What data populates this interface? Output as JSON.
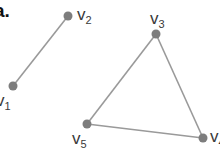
{
  "part_label": "a.",
  "colors": {
    "edge": "#9a9a9a",
    "vertex": "#7d7d7d",
    "text": "#3a3a3a"
  },
  "vertices": [
    {
      "id": "v1",
      "name": "v",
      "sub": "1",
      "x": 13,
      "y": 86
    },
    {
      "id": "v2",
      "name": "v",
      "sub": "2",
      "x": 68,
      "y": 16
    },
    {
      "id": "v3",
      "name": "v",
      "sub": "3",
      "x": 156,
      "y": 34
    },
    {
      "id": "v4",
      "name": "v",
      "sub": "4",
      "x": 203,
      "y": 138
    },
    {
      "id": "v5",
      "name": "v",
      "sub": "5",
      "x": 87,
      "y": 124
    }
  ],
  "edges": [
    [
      "v1",
      "v2"
    ],
    [
      "v3",
      "v5"
    ],
    [
      "v3",
      "v4"
    ],
    [
      "v5",
      "v4"
    ]
  ]
}
